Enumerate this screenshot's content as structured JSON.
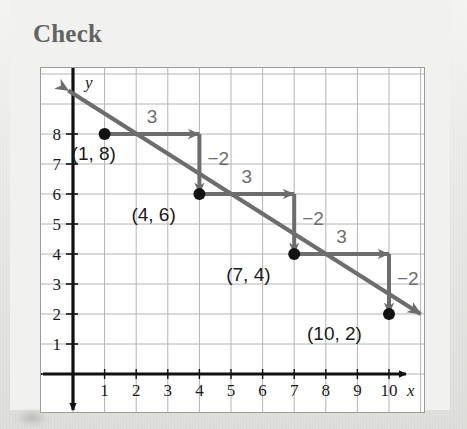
{
  "page": {
    "title": "Check",
    "background_color": "#e7e7e4",
    "panel_color": "#f1f1ef"
  },
  "chart_data": {
    "type": "line",
    "title": "Check",
    "xlabel": "x",
    "ylabel": "y",
    "xlim": [
      -0.9,
      11.1
    ],
    "ylim": [
      -0.6,
      10.2
    ],
    "x_ticks": [
      "1",
      "2",
      "3",
      "4",
      "5",
      "6",
      "7",
      "8",
      "9",
      "10"
    ],
    "x_tick_values": [
      1,
      2,
      3,
      4,
      5,
      6,
      7,
      8,
      9,
      10
    ],
    "y_ticks": [
      "1",
      "2",
      "3",
      "4",
      "5",
      "6",
      "7",
      "8"
    ],
    "y_tick_values": [
      1,
      2,
      3,
      4,
      5,
      6,
      7,
      8
    ],
    "grid": true,
    "grid_color": "#b4b4b4",
    "axis_color": "#111111",
    "line_color": "#6d6d6d",
    "point_color": "#111111",
    "legend": null,
    "series": [
      {
        "name": "line",
        "equation_slope": -0.6667,
        "equation_intercept": 8.6667,
        "points": [
          {
            "x": 1,
            "y": 8,
            "label": "(1, 8)"
          },
          {
            "x": 4,
            "y": 6,
            "label": "(4, 6)"
          },
          {
            "x": 7,
            "y": 4,
            "label": "(7, 4)"
          },
          {
            "x": 10,
            "y": 2,
            "label": "(10, 2)"
          }
        ],
        "arrow_start": {
          "x": -0.15,
          "y": 9.45
        },
        "arrow_end": {
          "x": 11.0,
          "y": 2.0
        }
      }
    ],
    "annotations": [
      {
        "name": "run-1",
        "text": "3",
        "from": {
          "x": 1,
          "y": 8
        },
        "to": {
          "x": 4,
          "y": 8
        },
        "kind": "run"
      },
      {
        "name": "rise-1",
        "text": "−2",
        "from": {
          "x": 4,
          "y": 8
        },
        "to": {
          "x": 4,
          "y": 6
        },
        "kind": "rise"
      },
      {
        "name": "run-2",
        "text": "3",
        "from": {
          "x": 4,
          "y": 6
        },
        "to": {
          "x": 7,
          "y": 6
        },
        "kind": "run"
      },
      {
        "name": "rise-2",
        "text": "−2",
        "from": {
          "x": 7,
          "y": 6
        },
        "to": {
          "x": 7,
          "y": 4
        },
        "kind": "rise"
      },
      {
        "name": "run-3",
        "text": "3",
        "from": {
          "x": 7,
          "y": 4
        },
        "to": {
          "x": 10,
          "y": 4
        },
        "kind": "run"
      },
      {
        "name": "rise-3",
        "text": "−2",
        "from": {
          "x": 10,
          "y": 4
        },
        "to": {
          "x": 10,
          "y": 2
        },
        "kind": "rise"
      }
    ],
    "point_labels": [
      {
        "text": "(1, 8)",
        "x": 1,
        "y": 8,
        "dx": -33,
        "dy": 26
      },
      {
        "text": "(4, 6)",
        "x": 4,
        "y": 6,
        "dx": -68,
        "dy": 27
      },
      {
        "text": "(7, 4)",
        "x": 7,
        "y": 4,
        "dx": -68,
        "dy": 27
      },
      {
        "text": "(10, 2)",
        "x": 10,
        "y": 2,
        "dx": -82,
        "dy": 26
      }
    ]
  }
}
